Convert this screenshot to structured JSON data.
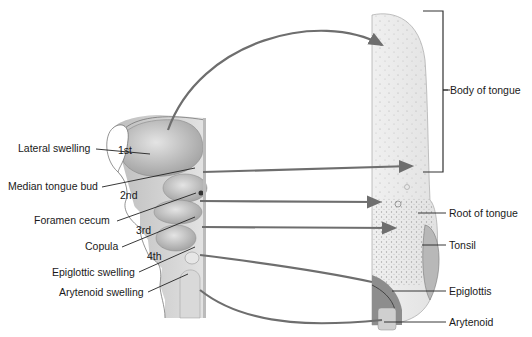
{
  "diagram": {
    "left_structure": "Embryonic pharyngeal floor",
    "right_structure": "Adult tongue",
    "arch_numbers": [
      "1st",
      "2nd",
      "3rd",
      "4th"
    ],
    "left_labels": [
      "Lateral swelling",
      "Median tongue bud",
      "Foramen cecum",
      "Copula",
      "Epiglottic swelling",
      "Arytenoid swelling"
    ],
    "right_labels": [
      "Body of tongue",
      "Root of tongue",
      "Tonsil",
      "Epiglottis",
      "Arytenoid"
    ],
    "colors": {
      "arrow": "#6e6e6e",
      "leader": "#222222",
      "tissue_light": "#ececec",
      "tissue_mid": "#c9c9c9",
      "tissue_dark": "#8a8a8a"
    }
  }
}
